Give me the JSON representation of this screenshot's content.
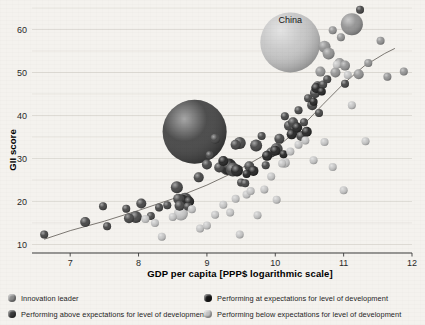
{
  "chart_data": {
    "type": "scatter",
    "title": "",
    "xlabel": "GDP per capita [PPP$ logarithmic scale]",
    "ylabel": "GII score",
    "xlim": [
      6.5,
      12
    ],
    "ylim": [
      8,
      65
    ],
    "xticks": [
      7,
      8,
      9,
      10,
      11,
      12
    ],
    "yticks": [
      10,
      20,
      30,
      40,
      50,
      60
    ],
    "grid": "horizontal",
    "legend_position": "bottom",
    "annotations": [
      {
        "text": "China",
        "x": 10.22,
        "y": 61.5
      }
    ],
    "trend_line": {
      "label": "fitted trend",
      "points": [
        [
          6.62,
          11.2
        ],
        [
          7.0,
          13.2
        ],
        [
          7.5,
          15.4
        ],
        [
          8.0,
          17.9
        ],
        [
          8.5,
          20.6
        ],
        [
          9.0,
          23.8
        ],
        [
          9.4,
          26.8
        ],
        [
          9.8,
          30.4
        ],
        [
          10.1,
          33.6
        ],
        [
          10.4,
          37.6
        ],
        [
          10.7,
          42.6
        ],
        [
          11.0,
          47.4
        ],
        [
          11.3,
          51.5
        ],
        [
          11.6,
          54.4
        ],
        [
          11.75,
          55.6
        ]
      ]
    },
    "series": [
      {
        "name": "Innovation leader",
        "color": "#8d8d8d",
        "points": [
          {
            "x": 11.12,
            "y": 61.2,
            "size": 11
          },
          {
            "x": 10.72,
            "y": 56.0,
            "size": 6
          },
          {
            "x": 10.78,
            "y": 54.4,
            "size": 6
          },
          {
            "x": 10.94,
            "y": 52.2,
            "size": 5
          },
          {
            "x": 10.66,
            "y": 50.2,
            "size": 5
          },
          {
            "x": 10.88,
            "y": 50.0,
            "size": 5
          },
          {
            "x": 11.02,
            "y": 51.6,
            "size": 5
          },
          {
            "x": 11.22,
            "y": 49.6,
            "size": 5
          },
          {
            "x": 11.54,
            "y": 57.4,
            "size": 4
          },
          {
            "x": 11.88,
            "y": 50.2,
            "size": 4
          },
          {
            "x": 11.64,
            "y": 49.0,
            "size": 4
          },
          {
            "x": 11.36,
            "y": 52.2,
            "size": 4
          },
          {
            "x": 10.96,
            "y": 58.2,
            "size": 4
          },
          {
            "x": 10.84,
            "y": 59.8,
            "size": 4
          }
        ]
      },
      {
        "name": "Performing above expectations for level of development",
        "color": "#3b3b3b",
        "points": [
          {
            "x": 8.82,
            "y": 36.2,
            "size": 32
          },
          {
            "x": 6.62,
            "y": 12.3,
            "size": 4
          },
          {
            "x": 7.22,
            "y": 15.2,
            "size": 5
          },
          {
            "x": 7.48,
            "y": 18.9,
            "size": 4
          },
          {
            "x": 7.54,
            "y": 14.2,
            "size": 4
          },
          {
            "x": 7.82,
            "y": 18.3,
            "size": 4
          },
          {
            "x": 7.86,
            "y": 16.1,
            "size": 5
          },
          {
            "x": 7.96,
            "y": 16.4,
            "size": 6
          },
          {
            "x": 8.04,
            "y": 19.5,
            "size": 5
          },
          {
            "x": 8.18,
            "y": 16.6,
            "size": 4
          },
          {
            "x": 8.3,
            "y": 18.6,
            "size": 4
          },
          {
            "x": 8.42,
            "y": 19.1,
            "size": 4
          },
          {
            "x": 8.56,
            "y": 23.3,
            "size": 6
          },
          {
            "x": 8.58,
            "y": 20.6,
            "size": 5
          },
          {
            "x": 8.6,
            "y": 19.0,
            "size": 5
          },
          {
            "x": 8.68,
            "y": 20.4,
            "size": 7
          },
          {
            "x": 8.72,
            "y": 18.8,
            "size": 4
          },
          {
            "x": 8.88,
            "y": 25.6,
            "size": 5
          },
          {
            "x": 9.0,
            "y": 28.6,
            "size": 5
          },
          {
            "x": 9.04,
            "y": 30.8,
            "size": 4
          },
          {
            "x": 9.12,
            "y": 34.6,
            "size": 5
          },
          {
            "x": 9.18,
            "y": 27.9,
            "size": 5
          },
          {
            "x": 9.3,
            "y": 28.0,
            "size": 8
          },
          {
            "x": 9.38,
            "y": 27.4,
            "size": 7
          },
          {
            "x": 9.42,
            "y": 33.2,
            "size": 5
          },
          {
            "x": 9.48,
            "y": 33.6,
            "size": 6
          },
          {
            "x": 9.5,
            "y": 24.4,
            "size": 4
          },
          {
            "x": 9.56,
            "y": 24.2,
            "size": 4
          },
          {
            "x": 9.62,
            "y": 28.2,
            "size": 5
          },
          {
            "x": 9.72,
            "y": 33.0,
            "size": 6
          },
          {
            "x": 9.8,
            "y": 35.2,
            "size": 4
          },
          {
            "x": 9.86,
            "y": 28.4,
            "size": 4
          },
          {
            "x": 9.94,
            "y": 31.4,
            "size": 5
          },
          {
            "x": 10.02,
            "y": 32.2,
            "size": 6
          },
          {
            "x": 10.06,
            "y": 34.6,
            "size": 5
          },
          {
            "x": 10.14,
            "y": 39.8,
            "size": 4
          },
          {
            "x": 10.2,
            "y": 37.6,
            "size": 5
          },
          {
            "x": 10.26,
            "y": 38.4,
            "size": 5
          },
          {
            "x": 10.3,
            "y": 36.6,
            "size": 5
          },
          {
            "x": 10.34,
            "y": 41.2,
            "size": 4
          },
          {
            "x": 10.38,
            "y": 35.2,
            "size": 5
          },
          {
            "x": 10.42,
            "y": 38.4,
            "size": 4
          },
          {
            "x": 10.48,
            "y": 44.0,
            "size": 4
          },
          {
            "x": 10.54,
            "y": 42.4,
            "size": 5
          },
          {
            "x": 10.58,
            "y": 45.2,
            "size": 5
          },
          {
            "x": 10.62,
            "y": 46.8,
            "size": 5
          },
          {
            "x": 10.64,
            "y": 40.6,
            "size": 4
          },
          {
            "x": 10.7,
            "y": 47.2,
            "size": 4
          },
          {
            "x": 10.76,
            "y": 48.4,
            "size": 4
          },
          {
            "x": 11.02,
            "y": 47.4,
            "size": 4
          },
          {
            "x": 11.24,
            "y": 64.6,
            "size": 4
          }
        ]
      },
      {
        "name": "Performing at expectations for level of development",
        "color": "#171717",
        "points": [
          {
            "x": 9.32,
            "y": 28.1,
            "size": 8
          },
          {
            "x": 9.44,
            "y": 27.2,
            "size": 6
          },
          {
            "x": 9.68,
            "y": 27.1,
            "size": 5
          },
          {
            "x": 9.88,
            "y": 30.6,
            "size": 5
          },
          {
            "x": 10.0,
            "y": 31.8,
            "size": 5
          },
          {
            "x": 10.12,
            "y": 31.0,
            "size": 4
          },
          {
            "x": 10.24,
            "y": 35.6,
            "size": 5
          },
          {
            "x": 10.32,
            "y": 37.2,
            "size": 5
          },
          {
            "x": 10.46,
            "y": 36.2,
            "size": 5
          },
          {
            "x": 10.56,
            "y": 43.2,
            "size": 4
          },
          {
            "x": 10.6,
            "y": 46.4,
            "size": 5
          },
          {
            "x": 10.68,
            "y": 45.6,
            "size": 4
          },
          {
            "x": 8.64,
            "y": 20.2,
            "size": 6
          },
          {
            "x": 8.74,
            "y": 20.0,
            "size": 5
          },
          {
            "x": 9.24,
            "y": 29.4,
            "size": 5
          },
          {
            "x": 9.58,
            "y": 26.4,
            "size": 4
          }
        ]
      },
      {
        "name": "Performing below expectations for level of development",
        "color": "#c3c3c3",
        "points": [
          {
            "x": 10.22,
            "y": 57.0,
            "size": 30
          },
          {
            "x": 8.1,
            "y": 15.9,
            "size": 4
          },
          {
            "x": 8.24,
            "y": 15.0,
            "size": 4
          },
          {
            "x": 8.34,
            "y": 11.8,
            "size": 4
          },
          {
            "x": 8.5,
            "y": 16.4,
            "size": 4
          },
          {
            "x": 8.62,
            "y": 17.2,
            "size": 7
          },
          {
            "x": 8.78,
            "y": 18.2,
            "size": 4
          },
          {
            "x": 8.9,
            "y": 13.7,
            "size": 4
          },
          {
            "x": 9.0,
            "y": 14.4,
            "size": 4
          },
          {
            "x": 9.12,
            "y": 16.9,
            "size": 4
          },
          {
            "x": 9.24,
            "y": 19.2,
            "size": 4
          },
          {
            "x": 9.34,
            "y": 17.4,
            "size": 4
          },
          {
            "x": 9.42,
            "y": 20.6,
            "size": 4
          },
          {
            "x": 9.48,
            "y": 12.3,
            "size": 4
          },
          {
            "x": 9.58,
            "y": 21.6,
            "size": 4
          },
          {
            "x": 9.64,
            "y": 22.4,
            "size": 4
          },
          {
            "x": 9.74,
            "y": 16.8,
            "size": 4
          },
          {
            "x": 9.84,
            "y": 22.8,
            "size": 4
          },
          {
            "x": 9.94,
            "y": 25.8,
            "size": 4
          },
          {
            "x": 10.02,
            "y": 20.4,
            "size": 4
          },
          {
            "x": 10.1,
            "y": 28.8,
            "size": 4
          },
          {
            "x": 10.14,
            "y": 29.0,
            "size": 5
          },
          {
            "x": 10.22,
            "y": 31.6,
            "size": 4
          },
          {
            "x": 10.34,
            "y": 33.2,
            "size": 4
          },
          {
            "x": 10.44,
            "y": 34.2,
            "size": 4
          },
          {
            "x": 10.56,
            "y": 29.6,
            "size": 4
          },
          {
            "x": 10.72,
            "y": 33.8,
            "size": 4
          },
          {
            "x": 10.84,
            "y": 28.0,
            "size": 4
          },
          {
            "x": 11.0,
            "y": 22.6,
            "size": 4
          },
          {
            "x": 11.12,
            "y": 42.4,
            "size": 4
          },
          {
            "x": 11.32,
            "y": 34.0,
            "size": 4
          },
          {
            "x": 10.9,
            "y": 51.8,
            "size": 4
          },
          {
            "x": 11.06,
            "y": 49.4,
            "size": 4
          }
        ]
      }
    ]
  },
  "legend": {
    "items": [
      {
        "label": "Innovation leader",
        "color": "#8d8d8d"
      },
      {
        "label": "Performing at expectations for level of development",
        "color": "#171717"
      },
      {
        "label": "Performing above expectations for level of development",
        "color": "#3b3b3b"
      },
      {
        "label": "Performing below expectations for level of development",
        "color": "#c3c3c3"
      }
    ]
  }
}
